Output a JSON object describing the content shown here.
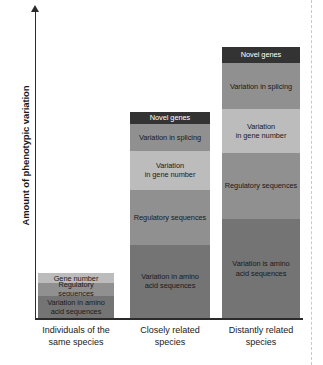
{
  "chart_data": {
    "type": "bar",
    "subtype": "stacked",
    "title": "",
    "xlabel": "",
    "ylabel": "Amount of phenotypic variation",
    "ylim": [
      0,
      100
    ],
    "grid": false,
    "legend": "none (segments labeled in place)",
    "axis": {
      "y_axis_style": "arrow-tipped, no tick labels, qualitative scale",
      "x_axis_style": "solid baseline, three categories"
    },
    "categories": [
      "Individuals of the same species",
      "Closely related species",
      "Distantly related species"
    ],
    "category_labels": [
      {
        "line1": "Individuals of the",
        "line2": "same species"
      },
      {
        "line1": "Closely related",
        "line2": "species"
      },
      {
        "line1": "Distantly related",
        "line2": "species"
      }
    ],
    "series": [
      {
        "name": "Variation in amino acid sequences",
        "label_lines": [
          "Variation in amino",
          "acid sequences"
        ],
        "color": "#747474",
        "text_color": "#1a1a1a",
        "values": [
          25,
          82,
          111
        ]
      },
      {
        "name": "Regulatory sequences",
        "label_lines": [
          "Regulatory sequences"
        ],
        "color": "#909090",
        "text_color": "#1a1a1a",
        "values": [
          14,
          62,
          74
        ]
      },
      {
        "name": "Variation in gene number",
        "label_lines": [
          "Variation",
          "in gene number"
        ],
        "color": "#bcbcbc",
        "text_color": "#1a1a1a",
        "values": [
          11,
          43,
          49
        ]
      },
      {
        "name": "Variation in splicing",
        "label_lines": [
          "Variation in splicing"
        ],
        "color": "#909090",
        "text_color": "#1a1a1a",
        "values": [
          0,
          31,
          52
        ]
      },
      {
        "name": "Novel genes",
        "label_lines": [
          "Novel genes"
        ],
        "color": "#333333",
        "text_color": "#ffffff",
        "values": [
          0,
          13,
          18
        ]
      }
    ],
    "totals": [
      50,
      231,
      304
    ],
    "notes": {
      "bar1_top_segment": "Gene number",
      "bar1_gene_number_label": "Gene number"
    }
  },
  "bars": [
    {
      "category_index": 0,
      "segments": [
        {
          "name": "Gene number",
          "label_lines": [
            "Gene number"
          ],
          "color": "#bcbcbc",
          "text": "light",
          "height": 11
        },
        {
          "name": "Regulatory sequences",
          "label_lines": [
            "Regulatory sequences"
          ],
          "color": "#909090",
          "text": "light",
          "height": 14
        },
        {
          "name": "Variation in amino acid sequences",
          "label_lines": [
            "Variation in amino",
            "acid sequences"
          ],
          "color": "#747474",
          "text": "light",
          "height": 25
        }
      ]
    },
    {
      "category_index": 1,
      "segments": [
        {
          "name": "Novel genes",
          "label_lines": [
            "Novel genes"
          ],
          "color": "#333333",
          "text": "dark",
          "height": 13
        },
        {
          "name": "Variation in splicing",
          "label_lines": [
            "Variation in splicing"
          ],
          "color": "#909090",
          "text": "light",
          "height": 31
        },
        {
          "name": "Variation in gene number",
          "label_lines": [
            "Variation",
            "in gene number"
          ],
          "color": "#bcbcbc",
          "text": "light",
          "height": 43
        },
        {
          "name": "Regulatory sequences",
          "label_lines": [
            "Regulatory sequences"
          ],
          "color": "#909090",
          "text": "light",
          "height": 62
        },
        {
          "name": "Variation in amino acid sequences",
          "label_lines": [
            "Variation in amino",
            "acid sequences"
          ],
          "color": "#747474",
          "text": "light",
          "height": 82
        }
      ]
    },
    {
      "category_index": 2,
      "segments": [
        {
          "name": "Novel genes",
          "label_lines": [
            "Novel genes"
          ],
          "color": "#333333",
          "text": "dark",
          "height": 18
        },
        {
          "name": "Variation in splicing",
          "label_lines": [
            "Variation in splicing"
          ],
          "color": "#909090",
          "text": "light",
          "height": 52
        },
        {
          "name": "Variation in gene number",
          "label_lines": [
            "Variation",
            "in gene number"
          ],
          "color": "#bcbcbc",
          "text": "light",
          "height": 49
        },
        {
          "name": "Regulatory sequences",
          "label_lines": [
            "Regulatory sequences"
          ],
          "color": "#909090",
          "text": "light",
          "height": 74
        },
        {
          "name": "Variation in amino acid sequences",
          "label_lines": [
            "Variation is amino",
            "acid sequences"
          ],
          "color": "#747474",
          "text": "light",
          "height": 111
        }
      ]
    }
  ]
}
